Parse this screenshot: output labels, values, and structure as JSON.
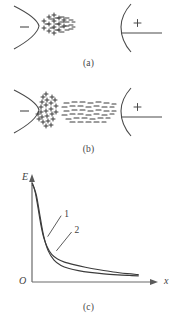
{
  "figure": {
    "title_semantic": "field-emission-space-charge-diagram",
    "panels": [
      {
        "id": "a",
        "caption": "(a)",
        "cathode_sign": "−",
        "anode_sign": "+",
        "charge_cloud": {
          "kind": "mixed-plus-minus-cluster",
          "description": "dense narrow cluster of + and - marks adjacent to cathode tip",
          "marks": [
            "+",
            "−"
          ],
          "count": 34
        }
      },
      {
        "id": "b",
        "caption": "(b)",
        "cathode_sign": "−",
        "anode_sign": "+",
        "charge_cloud": {
          "kind": "plus-cluster-and-minus-cloud",
          "description": "crescent of + marks hugging cathode plus separate horizontal cloud of - dashes mid-gap",
          "marks": [
            "+",
            "−"
          ],
          "plus_count": 30,
          "minus_count": 44
        }
      },
      {
        "id": "c",
        "caption": "(c)"
      }
    ]
  },
  "chart_data": {
    "type": "line",
    "title": "",
    "xlabel": "x",
    "ylabel": "E",
    "origin_label": "O",
    "grid": false,
    "legend_position": "inline-annotation",
    "xlim": [
      0,
      10
    ],
    "ylim": [
      0,
      10
    ],
    "axis_arrows": {
      "x": true,
      "y": true
    },
    "annotations": [
      {
        "text": "1",
        "x": 2.6,
        "y": 6.6,
        "leader_to_x": 1.35,
        "leader_to_y": 4.45
      },
      {
        "text": "2",
        "x": 3.5,
        "y": 5.0,
        "leader_to_x": 2.1,
        "leader_to_y": 3.05
      }
    ],
    "series": [
      {
        "name": "1",
        "x": [
          0.0,
          0.12,
          0.3,
          0.5,
          0.75,
          1.0,
          1.3,
          1.7,
          2.2,
          2.8,
          3.6,
          4.6,
          5.8,
          7.0,
          8.2,
          9.2
        ],
        "values": [
          9.7,
          9.45,
          8.7,
          7.4,
          5.7,
          4.4,
          3.45,
          2.7,
          2.25,
          1.95,
          1.7,
          1.45,
          1.2,
          0.98,
          0.82,
          0.72
        ]
      },
      {
        "name": "2",
        "x": [
          0.0,
          0.15,
          0.4,
          0.7,
          1.0,
          1.4,
          1.9,
          2.5,
          3.2,
          4.0,
          5.0,
          6.2,
          7.4,
          8.4,
          9.2
        ],
        "values": [
          9.55,
          9.3,
          8.4,
          6.4,
          4.55,
          3.05,
          2.15,
          1.62,
          1.32,
          1.12,
          0.95,
          0.8,
          0.7,
          0.64,
          0.6
        ]
      }
    ]
  }
}
